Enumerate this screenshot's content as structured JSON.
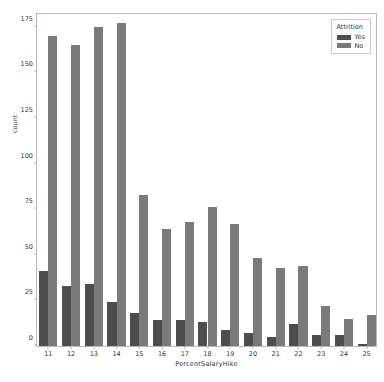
{
  "chart_data": {
    "type": "bar",
    "title": "",
    "xlabel": "PercentSalaryHike",
    "ylabel": "count",
    "categories": [
      "11",
      "12",
      "13",
      "14",
      "15",
      "16",
      "17",
      "18",
      "19",
      "20",
      "21",
      "22",
      "23",
      "24",
      "25"
    ],
    "series": [
      {
        "name": "Yes",
        "color": "#4d4d4d",
        "values": [
          41,
          33,
          34,
          24,
          18,
          14,
          14,
          13,
          9,
          7,
          5,
          12,
          6,
          6,
          1
        ]
      },
      {
        "name": "No",
        "color": "#7a7a7a",
        "values": [
          170,
          165,
          175,
          177,
          83,
          64,
          68,
          76,
          67,
          48,
          43,
          44,
          22,
          15,
          17
        ]
      }
    ],
    "ylim": [
      0,
      183
    ],
    "yticks": [
      0,
      25,
      50,
      75,
      100,
      125,
      150,
      175
    ],
    "grid": false,
    "legend": {
      "title": "Attrition",
      "position": "upper-right",
      "entries": [
        "Yes",
        "No"
      ]
    }
  }
}
